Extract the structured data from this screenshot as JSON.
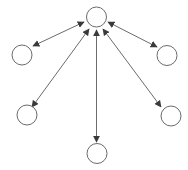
{
  "diagram": {
    "type": "star-network",
    "colors": {
      "background": "#ffffff",
      "node_stroke": "#6b6b6b",
      "node_fill": "#ffffff",
      "edge_stroke": "#6b6b6b",
      "arrowhead": "#3a3a3a"
    },
    "nodes": [
      {
        "id": "hub",
        "label": "",
        "cx": 96.5,
        "cy": 17,
        "r": 10
      },
      {
        "id": "left",
        "label": "",
        "cx": 22,
        "cy": 55,
        "r": 10
      },
      {
        "id": "right",
        "label": "",
        "cx": 167,
        "cy": 55.5,
        "r": 10
      },
      {
        "id": "lower-left",
        "label": "",
        "cx": 27,
        "cy": 115,
        "r": 10
      },
      {
        "id": "lower-right",
        "label": "",
        "cx": 171,
        "cy": 116,
        "r": 10
      },
      {
        "id": "bottom",
        "label": "",
        "cx": 97,
        "cy": 153.5,
        "r": 10
      }
    ],
    "edges": [
      {
        "from": "hub",
        "to": "left",
        "direction": "both",
        "x1": 84,
        "y1": 22,
        "x2": 33,
        "y2": 46
      },
      {
        "from": "hub",
        "to": "right",
        "direction": "both",
        "x1": 108,
        "y1": 22,
        "x2": 157,
        "y2": 47
      },
      {
        "from": "hub",
        "to": "lower-left",
        "direction": "both",
        "x1": 89,
        "y1": 29,
        "x2": 32,
        "y2": 107
      },
      {
        "from": "hub",
        "to": "lower-right",
        "direction": "both",
        "x1": 103,
        "y1": 29,
        "x2": 161,
        "y2": 107
      },
      {
        "from": "hub",
        "to": "bottom",
        "direction": "both",
        "x1": 96.5,
        "y1": 30,
        "x2": 96.5,
        "y2": 142
      }
    ]
  }
}
